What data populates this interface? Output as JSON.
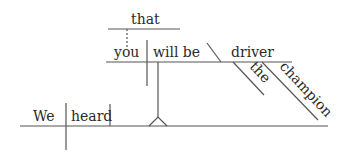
{
  "diagram": {
    "type": "reed-kellogg-sentence-diagram",
    "sentence_words": {
      "subject": "We",
      "verb": "heard",
      "clause_connector": "that",
      "clause_subject": "you",
      "clause_verb": "will be",
      "predicate_noun": "driver",
      "modifier_1": "the",
      "modifier_2": "champion"
    },
    "colors": {
      "line": "#555555",
      "text": "#2a2a2a",
      "background": "#ffffff"
    }
  }
}
